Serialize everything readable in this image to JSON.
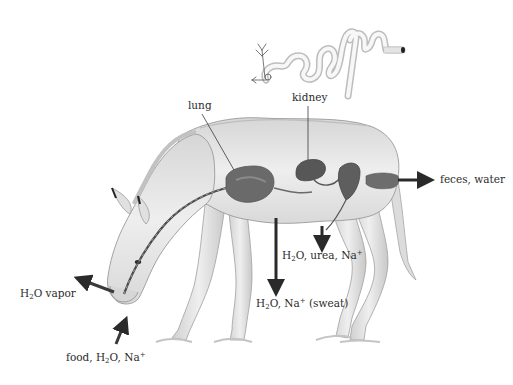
{
  "labels": {
    "kidney": "kidney",
    "lung": "lung",
    "feces": "feces, water",
    "urine": {
      "pre": "H",
      "sub": "2",
      "post": "O, urea, Na",
      "sup": "+"
    },
    "sweat": {
      "pre": "H",
      "sub": "2",
      "post": "O, Na",
      "sup": "+",
      "tail": " (sweat)"
    },
    "vapor": {
      "pre": "H",
      "sub": "2",
      "post": "O vapor"
    },
    "intake": {
      "pre": "food, H",
      "sub": "2",
      "post": "O, Na",
      "sup": "+"
    }
  },
  "colors": {
    "body": "#e9e9e9",
    "outline": "#9a9a9a",
    "organ": "#5c5c5c",
    "arrow": "#2a2a2a",
    "text": "#2b2b2b"
  }
}
